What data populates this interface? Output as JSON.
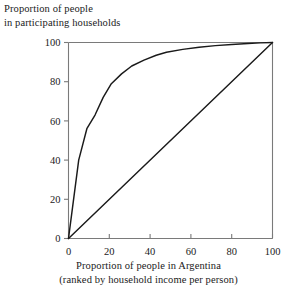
{
  "chart_data": {
    "type": "line",
    "title": "",
    "ylabel_lines": [
      "Proportion of people",
      "in participating households"
    ],
    "xlabel_lines": [
      "Proportion of people in Argentina",
      "(ranked by household income per person)"
    ],
    "xlabel": "Proportion of people in Argentina (ranked by household income per person)",
    "ylabel": "Proportion of people in participating households",
    "xlim": [
      0,
      100
    ],
    "ylim": [
      0,
      100
    ],
    "xticks": [
      0,
      20,
      40,
      60,
      80,
      100
    ],
    "yticks": [
      0,
      20,
      40,
      60,
      80,
      100
    ],
    "xticklabels": [
      "0",
      "20",
      "40",
      "60",
      "80",
      "100"
    ],
    "yticklabels": [
      "0",
      "20",
      "40",
      "60",
      "80",
      "100"
    ],
    "grid": false,
    "legend": "none",
    "axis_color": "#7a7a7a",
    "line_color": "#1a1a1a",
    "series": [
      {
        "name": "concentration-curve",
        "x": [
          0,
          2,
          5,
          9,
          13,
          17,
          21,
          26,
          31,
          37,
          43,
          48,
          56,
          64,
          72,
          80,
          88,
          94,
          100
        ],
        "y": [
          0,
          16,
          40,
          56,
          63,
          72,
          79,
          84,
          88,
          91,
          93.5,
          95,
          96.5,
          97.6,
          98.4,
          99,
          99.5,
          99.8,
          100
        ]
      },
      {
        "name": "equality-line",
        "x": [
          0,
          100
        ],
        "y": [
          0,
          100
        ]
      }
    ]
  },
  "axes": {
    "y_axis_label": {
      "line1": "Proportion of people",
      "line2": "in participating households"
    },
    "x_axis_label": {
      "line1": "Proportion of people in Argentina",
      "line2": "(ranked by household income per person)"
    }
  }
}
